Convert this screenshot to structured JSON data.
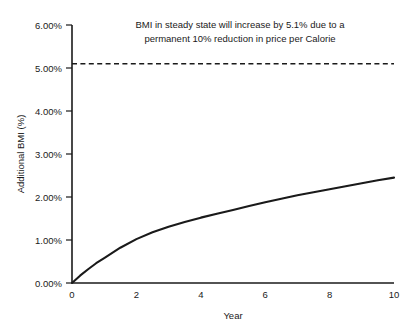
{
  "chart_data": {
    "type": "line",
    "title": "",
    "xlabel": "Year",
    "ylabel": "Additional BMI (%)",
    "xlim": [
      0,
      10
    ],
    "ylim": [
      0,
      6
    ],
    "grid": false,
    "legend": "none",
    "x_ticks": [
      0,
      2,
      4,
      6,
      8,
      10
    ],
    "x_tick_labels": [
      "0",
      "2",
      "4",
      "6",
      "8",
      "10"
    ],
    "y_ticks": [
      0,
      1,
      2,
      3,
      4,
      5,
      6
    ],
    "y_tick_labels": [
      "0.00%",
      "1.00%",
      "2.00%",
      "3.00%",
      "4.00%",
      "5.00%",
      "6.00%"
    ],
    "series": [
      {
        "name": "Additional BMI",
        "style": "solid",
        "x": [
          0,
          0.25,
          0.5,
          0.75,
          1,
          1.5,
          2,
          2.5,
          3,
          3.5,
          4,
          4.5,
          5,
          5.5,
          6,
          6.5,
          7,
          7.5,
          8,
          8.5,
          9,
          9.5,
          10
        ],
        "values": [
          0.0,
          0.17,
          0.32,
          0.46,
          0.58,
          0.82,
          1.02,
          1.18,
          1.31,
          1.42,
          1.52,
          1.61,
          1.7,
          1.79,
          1.88,
          1.96,
          2.04,
          2.11,
          2.18,
          2.25,
          2.32,
          2.39,
          2.45
        ]
      },
      {
        "name": "Steady state reference",
        "style": "dashed",
        "x": [
          0,
          10
        ],
        "values": [
          5.1,
          5.1
        ]
      }
    ],
    "annotations": [
      {
        "line1": "BMI in steady state will increase by 5.1% due to a",
        "line2": "permanent 10% reduction in price per Calorie",
        "at_y": 5.1
      }
    ]
  },
  "colors": {
    "ink": "#1a1a1a",
    "background": "#ffffff"
  }
}
